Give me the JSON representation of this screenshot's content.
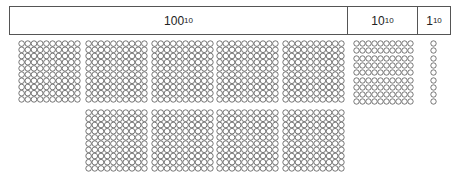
{
  "header": {
    "hundreds": {
      "base": "100",
      "sub": "10"
    },
    "tens": {
      "base": "10",
      "sub": "10"
    },
    "ones": {
      "base": "1",
      "sub": "10"
    }
  },
  "counts": {
    "hundreds": 9,
    "tens": 9,
    "ones": 9
  },
  "colors": {
    "stroke": "#555555",
    "fill": "#ffffff"
  }
}
